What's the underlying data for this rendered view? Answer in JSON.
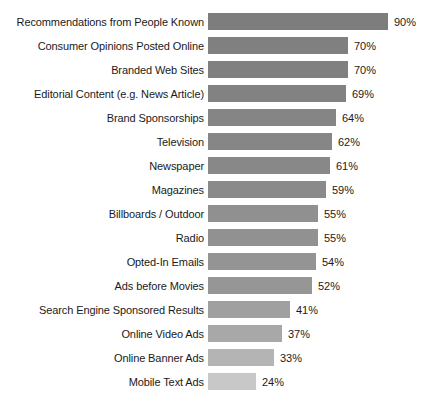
{
  "chart_data": {
    "type": "bar",
    "orientation": "horizontal",
    "title": "",
    "subtitle": "",
    "xlabel": "",
    "ylabel": "",
    "grid": false,
    "legend": false,
    "value_suffix": "%",
    "xlim": [
      0,
      90
    ],
    "categories": [
      "Recommendations from People Known",
      "Consumer Opinions Posted Online",
      "Branded Web Sites",
      "Editorial Content (e.g. News Article)",
      "Brand Sponsorships",
      "Television",
      "Newspaper",
      "Magazines",
      "Billboards / Outdoor",
      "Radio",
      "Opted-In Emails",
      "Ads before Movies",
      "Search Engine Sponsored Results",
      "Online Video Ads",
      "Online Banner Ads",
      "Mobile Text Ads"
    ],
    "values": [
      90,
      70,
      70,
      69,
      64,
      62,
      61,
      59,
      55,
      55,
      54,
      52,
      41,
      37,
      33,
      24
    ],
    "value_labels": [
      "90%",
      "70%",
      "70%",
      "69%",
      "64%",
      "62%",
      "61%",
      "59%",
      "55%",
      "55%",
      "54%",
      "52%",
      "41%",
      "37%",
      "33%",
      "24%"
    ],
    "bar_colors": [
      "#7d7d7d",
      "#808080",
      "#808080",
      "#828282",
      "#858585",
      "#868686",
      "#888888",
      "#8a8a8a",
      "#909090",
      "#919191",
      "#949494",
      "#969696",
      "#a0a0a0",
      "#a8a8a8",
      "#b4b4b4",
      "#c8c8c8"
    ],
    "background_color": "#ffffff",
    "text_color": "#1a1a1a",
    "px_per_unit": 2
  }
}
